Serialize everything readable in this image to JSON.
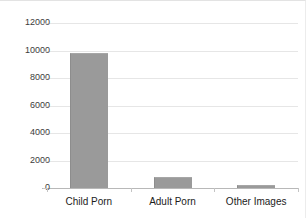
{
  "chart_data": {
    "type": "bar",
    "title": "",
    "xlabel": "",
    "ylabel": "",
    "categories": [
      "Child Porn",
      "Adult Porn",
      "Other Images"
    ],
    "values": [
      9800,
      800,
      250
    ],
    "ylim": [
      0,
      12000
    ],
    "yticks": [
      0,
      2000,
      4000,
      6000,
      8000,
      10000,
      12000
    ],
    "ytick_labels": [
      "0",
      "2000",
      "4000",
      "6000",
      "8000",
      "10000",
      "12000"
    ],
    "grid": true,
    "legend": "none",
    "bar_color": "#9a9a9a",
    "grid_color": "#e6e6e6",
    "axis_color": "#b8b8b8",
    "background": "#ffffff"
  }
}
